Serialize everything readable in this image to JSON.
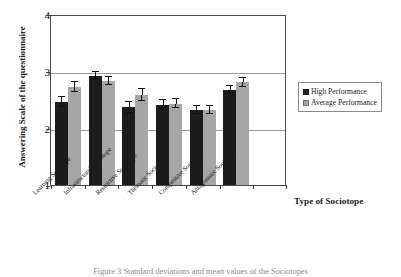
{
  "chart_data": {
    "type": "bar",
    "title": "",
    "xlabel": "Type of Sociotope",
    "ylabel": "Answering Scale of the questionnaire",
    "ylim": [
      1,
      4
    ],
    "yticks": [
      1,
      2,
      3,
      4
    ],
    "grid": true,
    "legend_position": "right",
    "categories": [
      "Learning Sociotope",
      "Infrastructural Sociotope",
      "Restrictive Sociotope",
      "Thematic Sociotope",
      "Competitive Sociotope",
      "Antagonistic Sociotope"
    ],
    "series": [
      {
        "name": "High Performance",
        "color": "#1c1c1c",
        "values": [
          2.45,
          2.91,
          2.36,
          2.41,
          2.31,
          2.67
        ],
        "errors": [
          0.09,
          0.07,
          0.09,
          0.08,
          0.07,
          0.07
        ]
      },
      {
        "name": "Average Performance",
        "color": "#a6a6a6",
        "values": [
          2.72,
          2.83,
          2.58,
          2.43,
          2.32,
          2.8
        ],
        "errors": [
          0.09,
          0.07,
          0.1,
          0.08,
          0.07,
          0.08
        ]
      }
    ]
  },
  "legend": {
    "items": [
      {
        "label": "High Performance",
        "color": "#1c1c1c"
      },
      {
        "label": "Average Performance",
        "color": "#a6a6a6"
      }
    ]
  },
  "axes": {
    "y_title": "Answering Scale of the questionnaire",
    "x_title": "Type of Sociotope",
    "y_ticks": [
      "4",
      "3",
      "2",
      "1"
    ]
  },
  "caption": "Figure 3 Standard deviations and mean values of the Sociotopes"
}
